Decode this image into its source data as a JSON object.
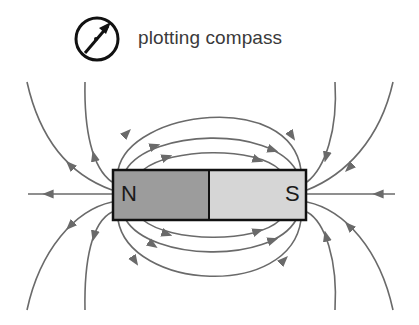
{
  "diagram": {
    "legend": {
      "icon": "plotting-compass-icon",
      "label": "plotting compass"
    },
    "magnet": {
      "north_label": "N",
      "south_label": "S",
      "north_color": "#9c9c9c",
      "south_color": "#d6d6d6",
      "outline_color": "#111111"
    },
    "field_lines": {
      "color": "#6a6a6a",
      "direction": "from N to S (outside magnet)",
      "count_above": 3,
      "count_below": 3,
      "count_axis": 2,
      "count_outer_left": 4,
      "count_outer_right": 4
    }
  }
}
